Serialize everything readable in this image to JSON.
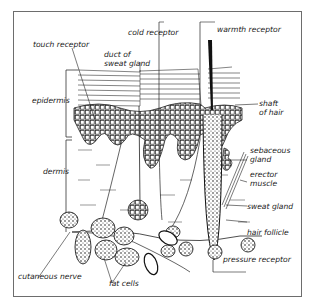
{
  "diagram": {
    "type": "skin cross-section",
    "labels": {
      "cold_receptor": "cold receptor",
      "warmth_receptor": "warmth receptor",
      "touch_receptor": "touch receptor",
      "duct_line1": "duct of",
      "duct_line2": "sweat gland",
      "epidermis": "epidermis",
      "dermis": "dermis",
      "shaft_line1": "shaft",
      "shaft_line2": "of hair",
      "sebaceous_line1": "sebaceous",
      "sebaceous_line2": "gland",
      "erector_line1": "erector",
      "erector_line2": "muscle",
      "sweat_gland": "sweat gland",
      "hair_follicle": "hair follicle",
      "pressure_receptor": "pressure receptor",
      "cutaneous_nerve": "cutaneous nerve",
      "fat_cells": "fat cells"
    },
    "colors": {
      "ink": "#1a1a1a",
      "frame": "#6d6d6d",
      "background": "#ffffff"
    }
  }
}
